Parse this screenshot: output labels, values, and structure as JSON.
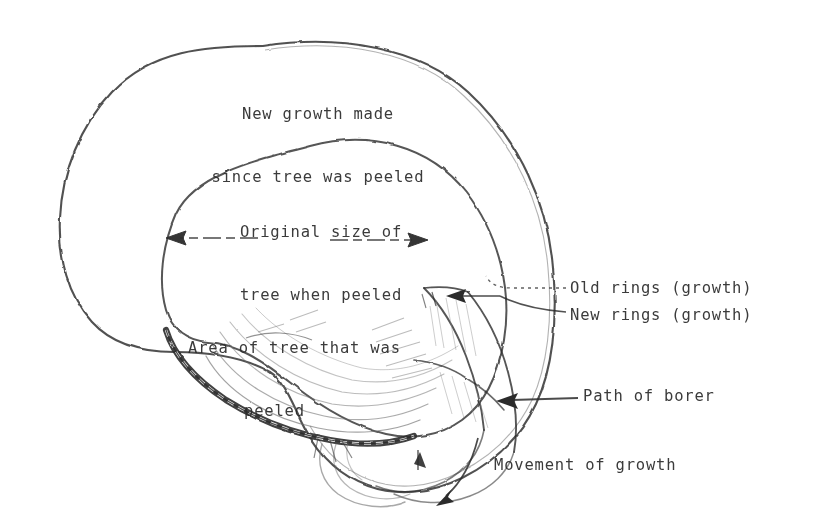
{
  "figure": {
    "kind": "hand-drawn-diagram",
    "background_color": "#ffffff",
    "ink_color": "#2b2b2b"
  },
  "labels": {
    "new_growth": {
      "line1": "New growth made",
      "line2": "since tree was peeled"
    },
    "original_size": {
      "line1": "Original size of",
      "line2": "tree when peeled"
    },
    "area_peeled": {
      "line1": "Area of tree that was",
      "line2": "peeled"
    },
    "old_rings": "Old rings (growth)",
    "new_rings": "New rings (growth)",
    "path_of_borer": "Path of borer",
    "movement_of_growth": "Movement of growth"
  },
  "annotations": {
    "diameter_arrow": "double-headed-arrow-original-size",
    "leader_old_rings": "dashed-leader-line",
    "leader_new_rings": "curved-leader-line",
    "leader_path_borer": "arrow-pointing-left",
    "leader_movement": "curved-arrow-pointing-down-left"
  }
}
